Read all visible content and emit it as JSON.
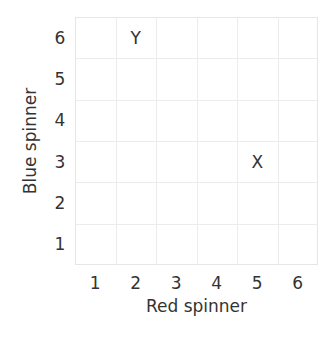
{
  "chart_data": {
    "type": "scatter",
    "title": "",
    "xlabel": "Red spinner",
    "ylabel": "Blue spinner",
    "x_ticks": [
      "1",
      "2",
      "3",
      "4",
      "5",
      "6"
    ],
    "y_ticks": [
      "1",
      "2",
      "3",
      "4",
      "5",
      "6"
    ],
    "xlim": [
      0.5,
      6.5
    ],
    "ylim": [
      0.5,
      6.5
    ],
    "grid": true,
    "legend": null,
    "points": [
      {
        "label": "Y",
        "x": 2,
        "y": 6
      },
      {
        "label": "X",
        "x": 5,
        "y": 3
      }
    ],
    "colors": {
      "grid": "#ececec",
      "text": "#333333",
      "background": "#ffffff"
    }
  }
}
